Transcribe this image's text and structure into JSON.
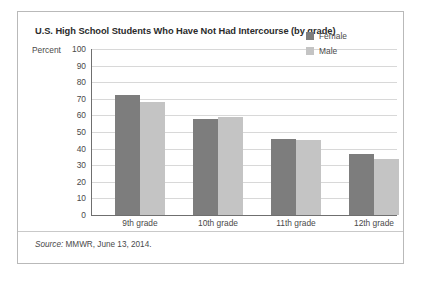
{
  "chart_data": {
    "type": "bar",
    "title": "U.S. High School Students Who Have Not Had Intercourse (by grade)",
    "xlabel": "",
    "ylabel": "Percent",
    "ylim": [
      0,
      100
    ],
    "ytick_step": 10,
    "yticks": [
      "100",
      "90",
      "80",
      "70",
      "60",
      "50",
      "40",
      "30",
      "20",
      "10",
      "0"
    ],
    "grid": true,
    "legend_position": "top-right",
    "categories": [
      "9th grade",
      "10th grade",
      "11th grade",
      "12th grade"
    ],
    "series": [
      {
        "name": "Female",
        "color": "#7d7d7d",
        "values": [
          72,
          58,
          46,
          37
        ]
      },
      {
        "name": "Male",
        "color": "#c4c4c4",
        "values": [
          68,
          59,
          45,
          34
        ]
      }
    ],
    "source_prefix": "Source:",
    "source_text": "MMWR, June 13, 2014."
  },
  "colors": {
    "female": "#7d7d7d",
    "male": "#c4c4c4",
    "axis": "#6f6f6f",
    "gridline": "#d8d8d8",
    "border": "#b9b9b9",
    "text": "#4a4a4a",
    "title": "#2b2b2b"
  }
}
